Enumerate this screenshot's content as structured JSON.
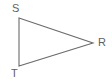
{
  "figure": {
    "type": "triangle-diagram",
    "background_color": "#ffffff",
    "stroke_color": "#6b6b6b",
    "stroke_width": 1.1,
    "label_color": "#5f5f5f",
    "canvas": {
      "width": 112,
      "height": 81
    }
  },
  "vertices": [
    {
      "id": "S",
      "label": "S",
      "x": 19,
      "y": 18,
      "label_x": 12,
      "label_y": 3
    },
    {
      "id": "T",
      "label": "T",
      "x": 19,
      "y": 66,
      "label_x": 11,
      "label_y": 68
    },
    {
      "id": "R",
      "label": "R",
      "x": 93,
      "y": 43,
      "label_x": 98,
      "label_y": 37
    }
  ],
  "edges": [
    {
      "id": "ST",
      "from": "S",
      "to": "T"
    },
    {
      "id": "SR",
      "from": "S",
      "to": "R"
    },
    {
      "id": "TR",
      "from": "T",
      "to": "R"
    }
  ],
  "polygon_points": "19,18 93,43 19,66"
}
